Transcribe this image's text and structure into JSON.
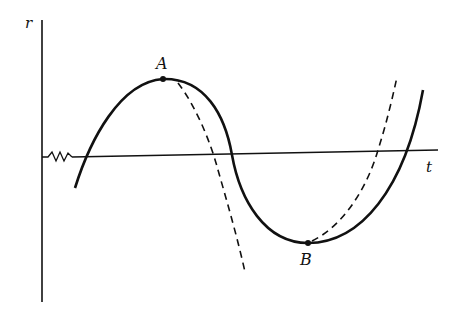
{
  "diagram": {
    "axes": {
      "vertical_label": "r",
      "horizontal_label": "t",
      "axis_break": "squiggle"
    },
    "points": [
      {
        "label": "A",
        "description": "maximum of solid curve"
      },
      {
        "label": "B",
        "description": "minimum of solid curve"
      }
    ],
    "curves": [
      {
        "style": "solid",
        "description": "oscillating curve r(t) with maximum at A and minimum at B"
      },
      {
        "style": "dashed",
        "description": "curve departing from A, falling steeply"
      },
      {
        "style": "dashed",
        "description": "curve departing from B, rising steeply"
      }
    ],
    "colors": {
      "ink": "#111111",
      "background": "#ffffff"
    }
  }
}
